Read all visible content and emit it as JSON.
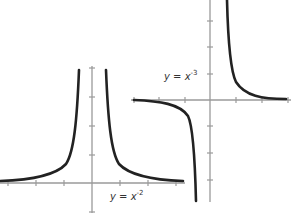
{
  "graphs": [
    {
      "id": "inverse-square",
      "label": {
        "base": "y = x",
        "exponent": "-2"
      },
      "equation": "y = x^-2",
      "colors": {
        "axis": "#9a9a9a",
        "curve": "#222222"
      }
    },
    {
      "id": "inverse-cube",
      "label": {
        "base": "y = x",
        "exponent": "-3"
      },
      "equation": "y = x^-3",
      "colors": {
        "axis": "#9a9a9a",
        "curve": "#222222"
      }
    }
  ]
}
